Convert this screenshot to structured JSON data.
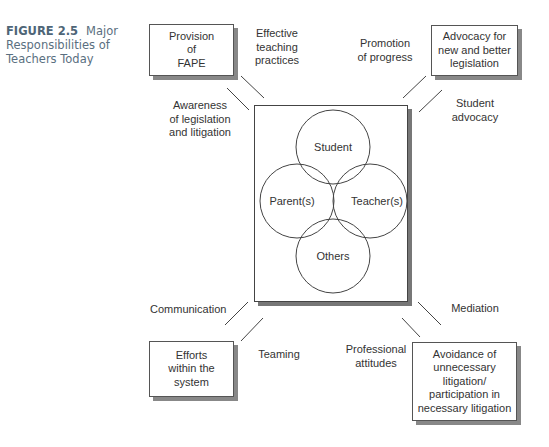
{
  "figure": {
    "number": "FIGURE 2.5",
    "title": "Major Responsibilities of Teachers Today"
  },
  "corner_boxes": {
    "top_left": "Provision\nof\nFAPE",
    "top_right": "Advocacy for\nnew and better\nlegislation",
    "bottom_left": "Efforts\nwithin the\nsystem",
    "bottom_right": "Avoidance of\nunnecessary\nlitigation/\nparticipation in\nnecessary litigation"
  },
  "connector_labels": {
    "effective_teaching": "Effective\nteaching\npractices",
    "awareness": "Awareness\nof legislation\nand litigation",
    "promotion": "Promotion\nof progress",
    "student_advocacy": "Student\nadvocacy",
    "communication": "Communication",
    "teaming": "Teaming",
    "mediation": "Mediation",
    "professional_attitudes": "Professional\nattitudes"
  },
  "venn": {
    "circles": [
      {
        "label": "Student",
        "cx": 333,
        "cy": 147,
        "r": 37
      },
      {
        "label": "Parent(s)",
        "cx": 297,
        "cy": 201,
        "r": 37
      },
      {
        "label": "Teacher(s)",
        "cx": 370,
        "cy": 201,
        "r": 37
      },
      {
        "label": "Others",
        "cx": 333,
        "cy": 256,
        "r": 37
      }
    ]
  },
  "colors": {
    "caption": "#5a6f80",
    "line": "#444444",
    "shadow": "#888888"
  }
}
